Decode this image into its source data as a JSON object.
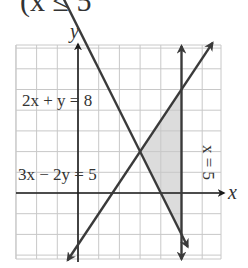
{
  "header": {
    "cropped_text": "(x ≤ 5"
  },
  "chart_data": {
    "type": "line",
    "title": "",
    "xlabel": "x",
    "ylabel": "y",
    "xlim": [
      -3,
      7
    ],
    "ylim": [
      -3.2,
      7.1
    ],
    "grid": true,
    "unit_px": 20.7,
    "origin_px": [
      78,
      193
    ],
    "grid_px": {
      "left": 16,
      "right": 221,
      "top": 45,
      "bottom": 259
    },
    "lines": [
      {
        "name": "2x + y = 8",
        "label": "2x + y = 8",
        "kind": "line",
        "p1": [
          -1.2,
          10.4
        ],
        "p2": [
          5.3,
          -2.6
        ],
        "label_px": [
          22,
          106
        ]
      },
      {
        "name": "3x − 2y = 5",
        "label": "3x − 2y = 5",
        "kind": "line",
        "p1": [
          -0.5,
          -3.25
        ],
        "p2": [
          6.5,
          7.25
        ],
        "label_px": [
          18,
          180
        ]
      },
      {
        "name": "x = 5",
        "label": "x = 5",
        "kind": "vertical",
        "x": 5,
        "y1": -3.2,
        "y2": 7.1,
        "label_px": [
          203,
          145
        ]
      }
    ],
    "shaded_region": {
      "color": "#dcdcdc",
      "vertices": [
        [
          3,
          2
        ],
        [
          5,
          5
        ],
        [
          5,
          -2
        ]
      ]
    },
    "intersection": [
      3,
      2
    ],
    "colors": {
      "lines": "#3a3a3a",
      "grid": "#c8c8c8",
      "shade": "#dcdcdc",
      "axis": "#1a1a1a"
    }
  }
}
